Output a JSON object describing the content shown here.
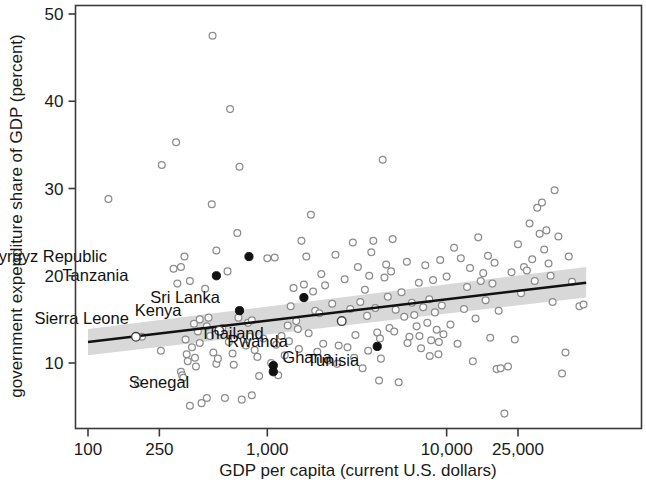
{
  "chart_data": {
    "type": "scatter",
    "title": "",
    "xlabel": "GDP per capita (current U.S. dollars)",
    "ylabel": "government expenditure share of GDP (percent)",
    "x_scale": "log",
    "y_scale": "linear",
    "xlim": [
      100,
      60000
    ],
    "ylim": [
      3.5,
      51.5
    ],
    "x_ticks": [
      100,
      250,
      1000,
      10000,
      25000
    ],
    "x_tick_labels": [
      "100",
      "250",
      "1,000",
      "10,000",
      "25,000"
    ],
    "y_ticks": [
      10,
      20,
      30,
      40,
      50
    ],
    "y_tick_labels": [
      "10",
      "20",
      "30",
      "40",
      "50"
    ],
    "grid": false,
    "legend": "none",
    "regression": {
      "description": "linear fit on log(GDP per capita) with shaded 95% confidence band",
      "x_start": 100,
      "y_start": 12.4,
      "x_end": 60000,
      "y_end": 19.2,
      "band_lower_start": 10.9,
      "band_upper_start": 13.9,
      "band_lower_end": 17.5,
      "band_upper_end": 21.0,
      "band_color": "#c9c9c9",
      "line_color": "#111111"
    },
    "labeled_points": [
      {
        "label": "Kyrgyz Republic",
        "x": 790,
        "y": 22.2,
        "marker": "filled",
        "label_dx": -142,
        "label_dy": 5
      },
      {
        "label": "Tanzania",
        "x": 520,
        "y": 20.0,
        "marker": "filled",
        "label_dx": -88,
        "label_dy": 5
      },
      {
        "label": "Sri Lanka",
        "x": 1600,
        "y": 17.5,
        "marker": "filled",
        "label_dx": -84,
        "label_dy": 5
      },
      {
        "label": "Kenya",
        "x": 700,
        "y": 16.0,
        "marker": "filled",
        "label_dx": -58,
        "label_dy": 5
      },
      {
        "label": "Sierra Leone",
        "x": 185,
        "y": 13.0,
        "marker": "open",
        "label_dx": -7,
        "label_dy": -13
      },
      {
        "label": "Rwanda",
        "x": 540,
        "y": 13.7,
        "marker": "open",
        "label_dx": 8,
        "label_dy": 16
      },
      {
        "label": "Thailand",
        "x": 2600,
        "y": 14.8,
        "marker": "open",
        "label_dx": -78,
        "label_dy": 18
      },
      {
        "label": "Ghana",
        "x": 1080,
        "y": 9.7,
        "marker": "filled",
        "label_dx": 9,
        "label_dy": -3
      },
      {
        "label": "Senegal",
        "x": 1080,
        "y": 9.0,
        "marker": "filled",
        "label_dx": -84,
        "label_dy": 16
      },
      {
        "label": "Tunisia",
        "x": 4100,
        "y": 11.9,
        "marker": "filled",
        "label_dx": -18,
        "label_dy": 20
      }
    ],
    "points": [
      [
        130,
        28.8
      ],
      [
        190,
        7.7
      ],
      [
        200,
        13.0
      ],
      [
        255,
        11.4
      ],
      [
        258,
        32.7
      ],
      [
        300,
        20.8
      ],
      [
        310,
        35.3
      ],
      [
        315,
        19.1
      ],
      [
        330,
        9.0
      ],
      [
        335,
        8.6
      ],
      [
        340,
        8.3
      ],
      [
        345,
        22.2
      ],
      [
        350,
        12.7
      ],
      [
        355,
        11.0
      ],
      [
        360,
        10.2
      ],
      [
        370,
        5.1
      ],
      [
        380,
        11.8
      ],
      [
        390,
        14.5
      ],
      [
        395,
        10.6
      ],
      [
        400,
        9.6
      ],
      [
        410,
        13.6
      ],
      [
        420,
        12.3
      ],
      [
        430,
        5.4
      ],
      [
        450,
        18.5
      ],
      [
        460,
        14.2
      ],
      [
        470,
        15.2
      ],
      [
        480,
        13.1
      ],
      [
        490,
        28.2
      ],
      [
        495,
        47.5
      ],
      [
        500,
        11.2
      ],
      [
        520,
        9.9
      ],
      [
        530,
        10.5
      ],
      [
        540,
        13.7
      ],
      [
        560,
        14.0
      ],
      [
        580,
        6.0
      ],
      [
        600,
        20.5
      ],
      [
        610,
        12.4
      ],
      [
        620,
        39.1
      ],
      [
        640,
        11.1
      ],
      [
        650,
        9.8
      ],
      [
        680,
        24.9
      ],
      [
        700,
        32.5
      ],
      [
        720,
        5.8
      ],
      [
        760,
        12.0
      ],
      [
        780,
        14.6
      ],
      [
        800,
        13.0
      ],
      [
        820,
        6.3
      ],
      [
        850,
        11.5
      ],
      [
        880,
        10.7
      ],
      [
        900,
        8.5
      ],
      [
        950,
        12.8
      ],
      [
        1000,
        22.0
      ],
      [
        1050,
        10.0
      ],
      [
        1100,
        22.1
      ],
      [
        1150,
        8.6
      ],
      [
        1200,
        13.1
      ],
      [
        1250,
        10.9
      ],
      [
        1300,
        14.3
      ],
      [
        1350,
        16.5
      ],
      [
        1400,
        18.6
      ],
      [
        1450,
        14.8
      ],
      [
        1500,
        11.6
      ],
      [
        1550,
        24.0
      ],
      [
        1600,
        19.0
      ],
      [
        1650,
        22.2
      ],
      [
        1700,
        13.4
      ],
      [
        1750,
        27.0
      ],
      [
        1800,
        18.2
      ],
      [
        1850,
        16.0
      ],
      [
        1900,
        11.3
      ],
      [
        1950,
        15.7
      ],
      [
        2000,
        20.2
      ],
      [
        2100,
        18.9
      ],
      [
        2200,
        10.3
      ],
      [
        2300,
        16.8
      ],
      [
        2400,
        22.4
      ],
      [
        2500,
        12.0
      ],
      [
        2600,
        14.8
      ],
      [
        2700,
        19.6
      ],
      [
        2800,
        11.8
      ],
      [
        2900,
        16.2
      ],
      [
        3000,
        23.8
      ],
      [
        3100,
        13.2
      ],
      [
        3200,
        21.0
      ],
      [
        3300,
        17.0
      ],
      [
        3400,
        9.4
      ],
      [
        3500,
        18.4
      ],
      [
        3600,
        15.4
      ],
      [
        3700,
        20.0
      ],
      [
        3800,
        22.7
      ],
      [
        3900,
        24.0
      ],
      [
        4000,
        16.3
      ],
      [
        4100,
        13.5
      ],
      [
        4200,
        8.0
      ],
      [
        4300,
        10.5
      ],
      [
        4400,
        33.3
      ],
      [
        4500,
        19.8
      ],
      [
        4600,
        21.3
      ],
      [
        4700,
        17.6
      ],
      [
        4800,
        14.0
      ],
      [
        4900,
        20.5
      ],
      [
        5000,
        24.2
      ],
      [
        5200,
        16.1
      ],
      [
        5400,
        7.8
      ],
      [
        5600,
        18.1
      ],
      [
        5800,
        15.3
      ],
      [
        6000,
        21.6
      ],
      [
        6200,
        13.0
      ],
      [
        6400,
        16.9
      ],
      [
        6600,
        15.5
      ],
      [
        6800,
        14.2
      ],
      [
        7000,
        19.2
      ],
      [
        7200,
        11.7
      ],
      [
        7400,
        16.4
      ],
      [
        7600,
        21.2
      ],
      [
        7800,
        14.6
      ],
      [
        8000,
        17.3
      ],
      [
        8200,
        12.6
      ],
      [
        8400,
        19.5
      ],
      [
        8600,
        15.8
      ],
      [
        8800,
        13.8
      ],
      [
        9000,
        11.0
      ],
      [
        9200,
        21.8
      ],
      [
        9400,
        16.6
      ],
      [
        9600,
        13.3
      ],
      [
        10000,
        19.9
      ],
      [
        10500,
        14.4
      ],
      [
        11000,
        23.2
      ],
      [
        11500,
        12.2
      ],
      [
        12000,
        22.0
      ],
      [
        12500,
        16.2
      ],
      [
        13000,
        18.7
      ],
      [
        13500,
        20.9
      ],
      [
        14000,
        10.2
      ],
      [
        14500,
        15.1
      ],
      [
        15000,
        24.4
      ],
      [
        15500,
        19.4
      ],
      [
        16000,
        20.3
      ],
      [
        16500,
        17.2
      ],
      [
        17000,
        22.3
      ],
      [
        17500,
        12.9
      ],
      [
        18000,
        19.1
      ],
      [
        18500,
        21.5
      ],
      [
        19000,
        9.3
      ],
      [
        19500,
        16.0
      ],
      [
        20000,
        9.4
      ],
      [
        21000,
        4.2
      ],
      [
        22000,
        9.6
      ],
      [
        23000,
        20.4
      ],
      [
        24000,
        12.7
      ],
      [
        25000,
        23.6
      ],
      [
        26000,
        18.0
      ],
      [
        27000,
        21.0
      ],
      [
        28000,
        20.6
      ],
      [
        29000,
        26.0
      ],
      [
        30000,
        21.9
      ],
      [
        31000,
        19.4
      ],
      [
        32000,
        27.8
      ],
      [
        33000,
        24.8
      ],
      [
        34000,
        28.4
      ],
      [
        35000,
        23.0
      ],
      [
        36000,
        25.2
      ],
      [
        37000,
        21.4
      ],
      [
        38000,
        20.0
      ],
      [
        39000,
        17.0
      ],
      [
        40000,
        29.8
      ],
      [
        42000,
        24.5
      ],
      [
        44000,
        8.8
      ],
      [
        46000,
        11.2
      ],
      [
        48000,
        22.2
      ],
      [
        50000,
        19.3
      ],
      [
        55000,
        16.5
      ],
      [
        58000,
        16.7
      ],
      [
        330,
        21.0
      ],
      [
        370,
        19.4
      ],
      [
        420,
        15.0
      ],
      [
        460,
        6.0
      ],
      [
        520,
        22.9
      ],
      [
        690,
        15.2
      ],
      [
        820,
        14.9
      ],
      [
        1120,
        12.1
      ],
      [
        1320,
        12.5
      ],
      [
        1480,
        13.9
      ],
      [
        2050,
        12.2
      ],
      [
        2450,
        9.9
      ],
      [
        3050,
        10.6
      ],
      [
        3650,
        11.4
      ],
      [
        4250,
        12.8
      ],
      [
        5100,
        13.6
      ],
      [
        6050,
        12.3
      ],
      [
        7050,
        13.1
      ],
      [
        8050,
        10.8
      ],
      [
        9050,
        12.4
      ]
    ]
  }
}
